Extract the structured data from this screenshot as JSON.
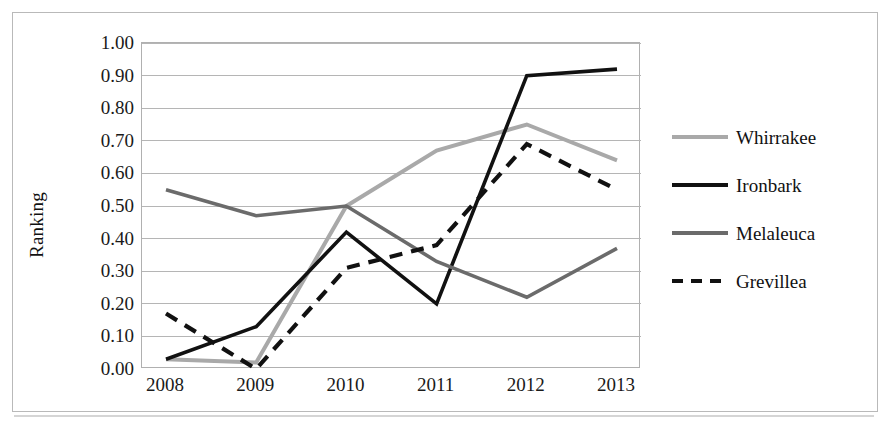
{
  "chart_data": {
    "type": "line",
    "title": "",
    "xlabel": "",
    "ylabel": "Ranking",
    "categories": [
      "2008",
      "2009",
      "2010",
      "2011",
      "2012",
      "2013"
    ],
    "x": [
      2008,
      2009,
      2010,
      2011,
      2012,
      2013
    ],
    "ylim": [
      0.0,
      1.0
    ],
    "ytick_step": 0.1,
    "yticks": [
      "1.00",
      "0.90",
      "0.80",
      "0.70",
      "0.60",
      "0.50",
      "0.40",
      "0.30",
      "0.20",
      "0.10",
      "0.00"
    ],
    "ytick_values": [
      1.0,
      0.9,
      0.8,
      0.7,
      0.6,
      0.5,
      0.4,
      0.3,
      0.2,
      0.1,
      0.0
    ],
    "grid": true,
    "grid_axis": "y",
    "legend_position": "right",
    "series": [
      {
        "name": "Whirrakee",
        "values": [
          0.03,
          0.02,
          0.5,
          0.67,
          0.75,
          0.64
        ],
        "color": "#a9a9a9",
        "style": "solid",
        "width": 4
      },
      {
        "name": "Ironbark",
        "values": [
          0.03,
          0.13,
          0.42,
          0.2,
          0.9,
          0.92
        ],
        "color": "#111111",
        "style": "solid",
        "width": 3.6
      },
      {
        "name": "Melaleuca",
        "values": [
          0.55,
          0.47,
          0.5,
          0.33,
          0.22,
          0.37
        ],
        "color": "#6b6b6b",
        "style": "solid",
        "width": 3.6
      },
      {
        "name": "Grevillea",
        "values": [
          0.17,
          0.0,
          0.31,
          0.38,
          0.69,
          0.55
        ],
        "color": "#111111",
        "style": "dashed",
        "width": 4.2
      }
    ]
  },
  "axes": {
    "y_title": "Ranking"
  },
  "legend": {
    "items": [
      {
        "label": "Whirrakee"
      },
      {
        "label": "Ironbark"
      },
      {
        "label": "Melaleuca"
      },
      {
        "label": "Grevillea"
      }
    ]
  },
  "colors": {
    "whirrakee": "#a9a9a9",
    "ironbark": "#111111",
    "melaleuca": "#6b6b6b",
    "grevillea": "#111111",
    "gridline": "#b5b5b5",
    "plot_border": "#b0b0b0",
    "outer_border": "#b9b9b9"
  }
}
